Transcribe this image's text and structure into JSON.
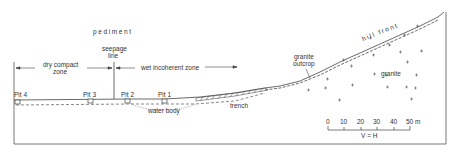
{
  "diagram": {
    "labels": {
      "pediment": "pediment",
      "hill_front": "hill front",
      "seepage_line_1": "seepage",
      "seepage_line_2": "line",
      "dry_zone_1": "dry compact",
      "dry_zone_2": "zone",
      "wet_zone": "wet incoherent zone",
      "granite_outcrop_1": "granite",
      "granite_outcrop_2": "outcrop",
      "granite": "granite",
      "water_body": "water body",
      "trench": "trench"
    },
    "pits": [
      {
        "label": "Pit 4"
      },
      {
        "label": "Pit 3"
      },
      {
        "label": "Pit 2"
      },
      {
        "label": "Pit 1"
      }
    ],
    "scale_bar": {
      "ticks": [
        "0",
        "10",
        "20",
        "30",
        "40",
        "50 m"
      ],
      "note": "V = H"
    },
    "colors": {
      "line": "#444444",
      "text": "#333333"
    }
  }
}
